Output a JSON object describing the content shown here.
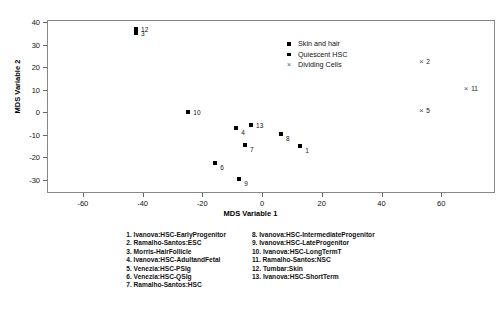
{
  "chart_data": {
    "type": "scatter",
    "title": "",
    "xlabel": "MDS Variable 1",
    "ylabel": "MDS Variable 2",
    "xlim": [
      -72,
      78
    ],
    "ylim": [
      -36,
      41
    ],
    "xticks": [
      -60,
      -40,
      -20,
      0,
      20,
      40,
      60
    ],
    "xticklabels": [
      "-60",
      "-40",
      "-20",
      "0",
      "20",
      "40",
      "60"
    ],
    "yticks": [
      40,
      30,
      20,
      10,
      0,
      -10,
      -20,
      -30
    ],
    "yticklabels": [
      "40",
      "30",
      "20",
      "10",
      "0",
      "-10",
      "-20",
      "-30"
    ],
    "grid": false,
    "legend_position": "top-center",
    "series": [
      {
        "name": "Skin and hair",
        "marker": "square",
        "color": "#000000",
        "points": [
          {
            "label": "12",
            "x": -42.5,
            "y": 37.5,
            "label_side": "right"
          },
          {
            "label": "3",
            "x": -42.5,
            "y": 35.5,
            "label_side": "right"
          }
        ]
      },
      {
        "name": "Quiescent HSC",
        "marker": "square",
        "color": "#000000",
        "points": [
          {
            "label": "10",
            "x": -25.0,
            "y": 0.5,
            "label_side": "right"
          },
          {
            "label": "4",
            "x": -9.0,
            "y": -6.5,
            "label_side": "right-low"
          },
          {
            "label": "13",
            "x": -4.0,
            "y": -5.5,
            "label_side": "right"
          },
          {
            "label": "7",
            "x": -6.0,
            "y": -14.0,
            "label_side": "right-low"
          },
          {
            "label": "8",
            "x": 6.0,
            "y": -9.5,
            "label_side": "right-low"
          },
          {
            "label": "1",
            "x": 12.5,
            "y": -14.5,
            "label_side": "right-low"
          },
          {
            "label": "6",
            "x": -16.0,
            "y": -22.0,
            "label_side": "right-low"
          },
          {
            "label": "9",
            "x": -8.0,
            "y": -29.5,
            "label_side": "right-low"
          }
        ]
      },
      {
        "name": "Dividing Cells",
        "marker": "x",
        "color": "#555555",
        "points": [
          {
            "label": "2",
            "x": 53.0,
            "y": 23.0,
            "label_side": "right"
          },
          {
            "label": "11",
            "x": 68.0,
            "y": 11.0,
            "label_side": "right"
          },
          {
            "label": "5",
            "x": 53.0,
            "y": 1.5,
            "label_side": "right"
          }
        ]
      }
    ],
    "legend_entries": [
      {
        "marker": "square",
        "label": "Skin and hair"
      },
      {
        "marker": "square",
        "label": "Quiescent HSC"
      },
      {
        "marker": "x",
        "label": "Dividing Cells"
      }
    ],
    "annotations": {
      "key_left": [
        "1. Ivanova:HSC-EarlyProgenitor",
        "2. Ramalho-Santos:ESC",
        "3. Morris-HairFollicle",
        "4. Ivanova:HSC-AdultandFetal",
        "5. Venezia:HSC-PSIg",
        "6. Venezia:HSC-QSIg",
        "7. Ramalho-Santos:HSC"
      ],
      "key_right": [
        "8. Ivanova:HSC-IntermediateProgenitor",
        "9. Ivanova:HSC-LateProgenitor",
        "10. Ivanova:HSC-LongTermT",
        "11. Ramalho-Santos:NSC",
        "12. Tumbar:Skin",
        "13. Ivanova:HSC-ShortTerm"
      ]
    }
  }
}
